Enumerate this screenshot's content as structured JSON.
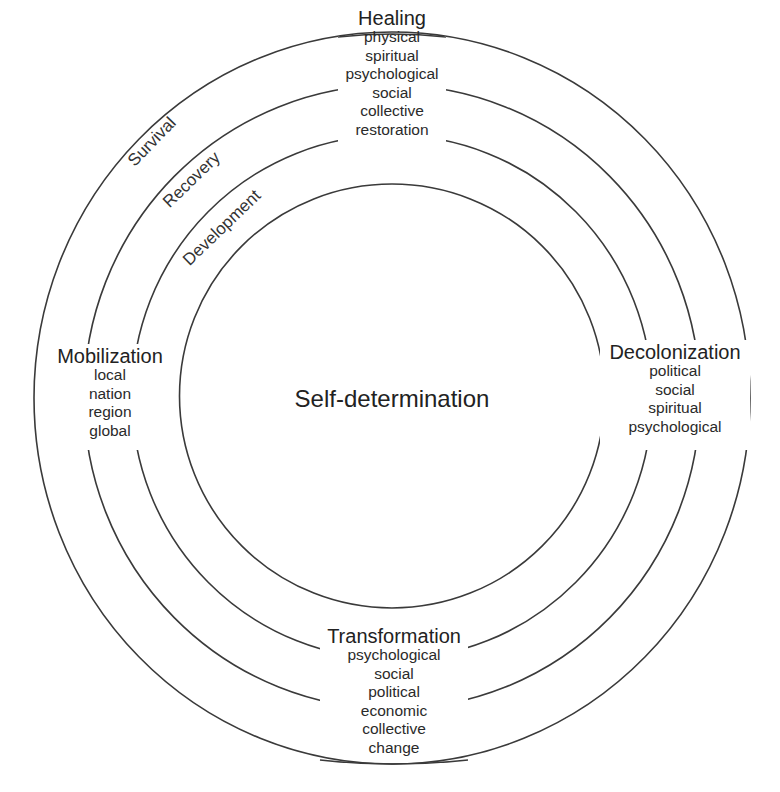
{
  "diagram": {
    "type": "concentric-circles",
    "center": {
      "label": "Self-determination"
    },
    "rings": [
      {
        "name": "Development"
      },
      {
        "name": "Recovery"
      },
      {
        "name": "Survival"
      }
    ],
    "ring_labels": {
      "survival": "Survival",
      "recovery": "Recovery",
      "development": "Development"
    },
    "quadrants": {
      "top": {
        "title": "Healing",
        "items": [
          "physical",
          "spiritual",
          "psychological",
          "social",
          "collective",
          "restoration"
        ]
      },
      "left": {
        "title": "Mobilization",
        "items": [
          "local",
          "nation",
          "region",
          "global"
        ]
      },
      "right": {
        "title": "Decolonization",
        "items": [
          "political",
          "social",
          "spiritual",
          "psychological"
        ]
      },
      "bottom": {
        "title": "Transformation",
        "items": [
          "psychological",
          "social",
          "political",
          "economic",
          "collective",
          "change"
        ]
      }
    },
    "colors": {
      "line": "#3a3a3a",
      "text": "#2a2a2a",
      "background": "#ffffff"
    }
  }
}
